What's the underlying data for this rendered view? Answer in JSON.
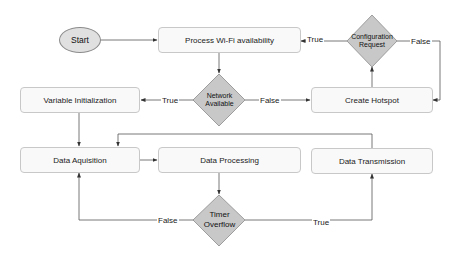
{
  "diagram": {
    "type": "flowchart",
    "colors": {
      "process_fill": "#f9f9f9",
      "process_border": "#c8c8c8",
      "decision_fill": "#c8c8c8",
      "decision_border": "#8c8c8c",
      "terminator_fill": "#e0e0e0",
      "edge": "#444444"
    },
    "nodes": {
      "start": {
        "label": "Start",
        "shape": "ellipse"
      },
      "process_wifi": {
        "label": "Process Wi-Fi availability",
        "shape": "rounded-rect"
      },
      "config_request": {
        "label_line1": "Configuration",
        "label_line2": "Request",
        "shape": "diamond"
      },
      "network_available": {
        "label_line1": "Network",
        "label_line2": "Available",
        "shape": "diamond"
      },
      "variable_init": {
        "label": "Variable Initialization",
        "shape": "rounded-rect"
      },
      "create_hotspot": {
        "label": "Create Hotspot",
        "shape": "rounded-rect"
      },
      "data_acquisition": {
        "label": "Data Aquisition",
        "shape": "rounded-rect"
      },
      "data_processing": {
        "label": "Data Processing",
        "shape": "rounded-rect"
      },
      "data_transmission": {
        "label": "Data Transmission",
        "shape": "rounded-rect"
      },
      "timer_overflow": {
        "label_line1": "Timer",
        "label_line2": "Overflow",
        "shape": "diamond"
      }
    },
    "edges": {
      "start_to_wifi": {
        "from": "start",
        "to": "process_wifi",
        "label": ""
      },
      "wifi_to_network": {
        "from": "process_wifi",
        "to": "network_available",
        "label": ""
      },
      "network_true": {
        "from": "network_available",
        "to": "variable_init",
        "label": "True"
      },
      "network_false": {
        "from": "network_available",
        "to": "create_hotspot",
        "label": "False"
      },
      "hotspot_to_config": {
        "from": "create_hotspot",
        "to": "config_request",
        "label": ""
      },
      "config_true": {
        "from": "config_request",
        "to": "process_wifi",
        "label": "True"
      },
      "config_false": {
        "from": "config_request",
        "to": "create_hotspot",
        "label": "False"
      },
      "init_to_acq": {
        "from": "variable_init",
        "to": "data_acquisition",
        "label": ""
      },
      "acq_to_proc": {
        "from": "data_acquisition",
        "to": "data_processing",
        "label": ""
      },
      "proc_to_timer": {
        "from": "data_processing",
        "to": "timer_overflow",
        "label": ""
      },
      "timer_false": {
        "from": "timer_overflow",
        "to": "data_acquisition",
        "label": "False"
      },
      "timer_true": {
        "from": "timer_overflow",
        "to": "data_transmission",
        "label": "True"
      },
      "trans_to_acq": {
        "from": "data_transmission",
        "to": "data_acquisition",
        "label": ""
      }
    }
  }
}
